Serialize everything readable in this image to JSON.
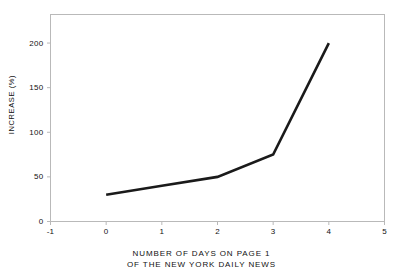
{
  "chart_data": {
    "type": "line",
    "title": "",
    "subtitle": "",
    "xlabel_line1": "NUMBER OF DAYS ON PAGE 1",
    "xlabel_line2": "OF THE NEW YORK DAILY NEWS",
    "ylabel": "INCREASE (%)",
    "x": [
      0,
      1,
      2,
      3,
      4
    ],
    "values": [
      30,
      40,
      50,
      75,
      200
    ],
    "series": [
      {
        "name": "increase",
        "x": [
          0,
          1,
          2,
          3,
          4
        ],
        "values": [
          30,
          40,
          50,
          75,
          200
        ]
      }
    ],
    "xlim": [
      -1,
      5
    ],
    "ylim": [
      0,
      232
    ],
    "xticks": [
      "-1",
      "0",
      "1",
      "2",
      "3",
      "4",
      "5"
    ],
    "xtick_values": [
      -1,
      0,
      1,
      2,
      3,
      4,
      5
    ],
    "yticks": [
      "0",
      "50",
      "100",
      "150",
      "200"
    ],
    "ytick_values": [
      0,
      50,
      100,
      150,
      200
    ],
    "grid": false,
    "legend": "none",
    "line_color": "#1a1a1a",
    "line_width": 2.6,
    "frame_color": "#b9b9b9",
    "background": "#ffffff"
  }
}
